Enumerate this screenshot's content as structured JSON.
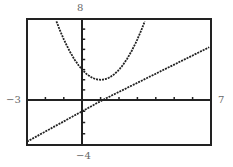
{
  "chart_data": {
    "type": "line",
    "title": "",
    "xlabel": "",
    "ylabel": "",
    "xlim": [
      -3,
      7
    ],
    "ylim": [
      -4,
      8
    ],
    "xscale": 1,
    "yscale": 1,
    "window_labels": {
      "xmin": "−3",
      "xmax": "7",
      "ymin": "−4",
      "ymax": "8"
    },
    "series": [
      {
        "name": "parabola",
        "equation": "y = (x-1)^2 + 2",
        "vertex": [
          1,
          2
        ],
        "y_intercept": 3
      },
      {
        "name": "line",
        "equation": "y = 0.9x - 1",
        "y_intercept": -1,
        "x_intercept": 1.1
      }
    ],
    "grid": false,
    "legend": null
  },
  "labels": {
    "xmin": "−3",
    "xmax": "7",
    "ymin": "−4",
    "ymax": "8"
  }
}
